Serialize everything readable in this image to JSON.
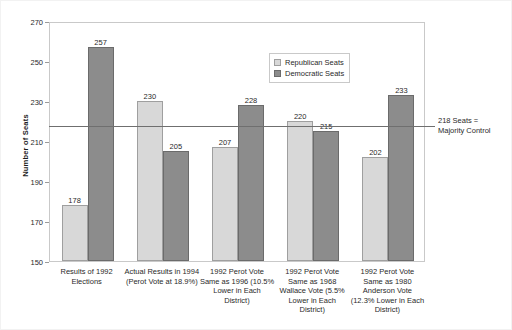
{
  "chart_data": {
    "type": "bar",
    "title": "",
    "xlabel": "",
    "ylabel": "Number of Seats",
    "ylim": [
      150,
      270
    ],
    "ytick_step": 20,
    "yticks": [
      150,
      170,
      190,
      210,
      230,
      250,
      270
    ],
    "grid": false,
    "legend_position": "upper-center",
    "categories": [
      "Results of 1992 Elections",
      "Actual Results in 1994 (Perot Vote at 18.9%)",
      "1992 Perot Vote Same as 1996 (10.5% Lower in Each District)",
      "1992 Perot Vote Same as 1968 Wallace Vote (5.5% Lower in Each District)",
      "1992 Perot Vote Same as 1980 Anderson Vote (12.3% Lower in Each District)"
    ],
    "category_lines": [
      [
        "Results of 1992",
        "Elections"
      ],
      [
        "Actual Results in 1994",
        "(Perot Vote at 18.9%)"
      ],
      [
        "1992 Perot Vote",
        "Same as 1996 (10.5%",
        "Lower in Each",
        "District)"
      ],
      [
        "1992 Perot Vote",
        "Same as 1968",
        "Wallace Vote (5.5%",
        "Lower in Each",
        "District)"
      ],
      [
        "1992 Perot Vote",
        "Same as 1980",
        "Anderson Vote",
        "(12.3% Lower in Each",
        "District)"
      ]
    ],
    "series": [
      {
        "name": "Republican Seats",
        "color": "#d8d8d8",
        "values": [
          178,
          230,
          207,
          220,
          202
        ]
      },
      {
        "name": "Democratic Seats",
        "color": "#8c8c8c",
        "values": [
          257,
          205,
          228,
          215,
          233
        ]
      }
    ],
    "annotations": [
      {
        "name": "majority-threshold",
        "value": 218,
        "lines": [
          "218 Seats =",
          "Majority Control"
        ]
      }
    ]
  }
}
